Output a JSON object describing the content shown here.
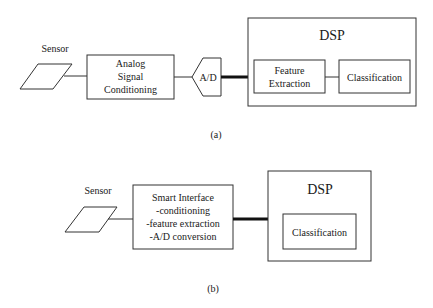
{
  "diagram_a": {
    "caption": "(a)",
    "sensor_label": "Sensor",
    "conditioning_lines": [
      "Analog",
      "Signal",
      "Conditioning"
    ],
    "adc_label": "A/D",
    "dsp_title": "DSP",
    "feature_lines": [
      "Feature",
      "Extraction"
    ],
    "classification_label": "Classification"
  },
  "diagram_b": {
    "caption": "(b)",
    "sensor_label": "Sensor",
    "smart_interface_lines": [
      "Smart Interface",
      "-conditioning",
      "-feature extraction",
      "-A/D conversion"
    ],
    "dsp_title": "DSP",
    "classification_label": "Classification"
  }
}
